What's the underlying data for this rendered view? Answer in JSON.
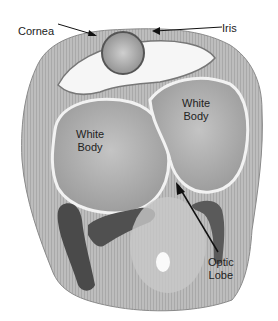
{
  "figure": {
    "labels": {
      "cornea": "Cornea",
      "iris": "Iris",
      "white_body_left_1": "White",
      "white_body_left_2": "Body",
      "white_body_right_1": "White",
      "white_body_right_2": "Body",
      "optic_lobe_1": "Optic",
      "optic_lobe_2": "Lobe"
    },
    "colors": {
      "tissue_light": "#d8d8d8",
      "tissue_mid": "#a8a8a8",
      "tissue_dark": "#4a4a4a",
      "background": "#ffffff",
      "label_text": "#222222"
    }
  }
}
